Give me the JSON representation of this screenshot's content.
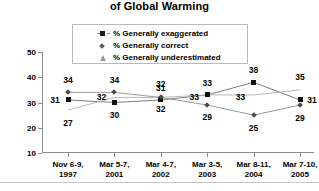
{
  "title": "of Global Warming",
  "legend": {
    "position": "top-center",
    "items": [
      {
        "label": "% Generally exaggerated",
        "marker": "square-marker",
        "color": "#111111"
      },
      {
        "label": "% Generally correct",
        "marker": "diamond-marker",
        "color": "#4d4d4d"
      },
      {
        "label": "% Generally underestimated",
        "marker": "triangle-marker",
        "color": "#a5a5a5"
      }
    ]
  },
  "axis": {
    "y_ticks": [
      "10",
      "20",
      "30",
      "40",
      "50"
    ],
    "x_labels": [
      {
        "line1": "Nov 6-9,",
        "line2": "1997"
      },
      {
        "line1": "Mar 5-7,",
        "line2": "2001"
      },
      {
        "line1": "Mar 4-7,",
        "line2": "2002"
      },
      {
        "line1": "Mar 3-5,",
        "line2": "2003"
      },
      {
        "line1": "Mar 8-11,",
        "line2": "2004"
      },
      {
        "line1": "Mar 7-10,",
        "line2": "2005"
      }
    ]
  },
  "chart_data": {
    "type": "line",
    "title": "of Global Warming",
    "xlabel": "",
    "ylabel": "",
    "ylim": [
      10,
      50
    ],
    "yticks": [
      10,
      20,
      30,
      40,
      50
    ],
    "grid": false,
    "legend_position": "top-center",
    "categories": [
      "Nov 6-9, 1997",
      "Mar 5-7, 2001",
      "Mar 4-7, 2002",
      "Mar 3-5, 2003",
      "Mar 8-11, 2004",
      "Mar 7-10, 2005"
    ],
    "series": [
      {
        "name": "% Generally exaggerated",
        "marker": "square",
        "color": "#111111",
        "values": [
          31,
          30,
          31,
          33,
          38,
          31
        ]
      },
      {
        "name": "% Generally correct",
        "marker": "diamond",
        "color": "#4d4d4d",
        "values": [
          34,
          34,
          32,
          29,
          25,
          29
        ]
      },
      {
        "name": "% Generally underestimated",
        "marker": "triangle",
        "color": "#a5a5a5",
        "values": [
          27,
          32,
          32,
          33,
          33,
          35
        ]
      }
    ]
  }
}
